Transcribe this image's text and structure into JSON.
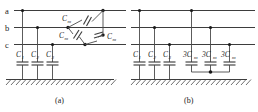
{
  "figure": {
    "panels": [
      {
        "id": "a",
        "caption": "(a)",
        "phase_labels": [
          "a",
          "b",
          "c"
        ],
        "shunt_capacitors": [
          {
            "label": "C",
            "subscript": "1"
          },
          {
            "label": "C",
            "subscript": "2"
          },
          {
            "label": "C",
            "subscript": "3"
          }
        ],
        "mutual_capacitors": [
          {
            "label": "C",
            "subscript": "m"
          },
          {
            "label": "C",
            "subscript": "m"
          },
          {
            "label": "C",
            "subscript": "m"
          }
        ],
        "ground_symbol": "hatched-earth"
      },
      {
        "id": "b",
        "caption": "(b)",
        "phase_labels": [
          "a",
          "b",
          "c"
        ],
        "shunt_capacitors": [
          {
            "label": "C",
            "subscript": "1"
          },
          {
            "label": "C",
            "subscript": "2"
          },
          {
            "label": "C",
            "subscript": "3"
          }
        ],
        "star_capacitors": [
          {
            "label": "3C",
            "subscript": "m"
          },
          {
            "label": "3C",
            "subscript": "m"
          },
          {
            "label": "3C",
            "subscript": "m"
          }
        ],
        "ground_symbol": "hatched-earth"
      }
    ],
    "colors": {
      "wire": "#3d3d3d",
      "text": "#1a1a1a",
      "background": "#ffffff"
    }
  }
}
